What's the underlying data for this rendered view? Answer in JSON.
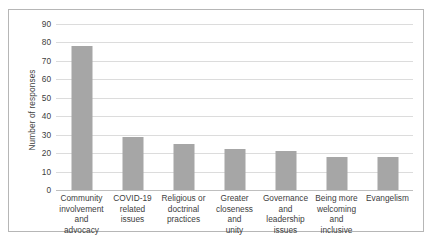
{
  "chart_data": {
    "type": "bar",
    "title": "",
    "xlabel": "",
    "ylabel": "Number of responses",
    "ylim": [
      0,
      90
    ],
    "ytick_step": 10,
    "yticks": [
      0,
      10,
      20,
      30,
      40,
      50,
      60,
      70,
      80,
      90
    ],
    "grid": true,
    "legend": false,
    "bar_color": "#a6a6a6",
    "categories": [
      "Community involvement and advocacy",
      "COVID-19 related issues",
      "Religious or doctrinal practices",
      "Greater closeness and unity",
      "Governance and leadership issues",
      "Being more welcoming and inclusive",
      "Evangelism"
    ],
    "category_lines": [
      [
        "Community",
        "involvement",
        "and advocacy"
      ],
      [
        "COVID-19",
        "related issues"
      ],
      [
        "Religious or",
        "doctrinal",
        "practices"
      ],
      [
        "Greater",
        "closeness and",
        "unity"
      ],
      [
        "Governance and",
        "leadership",
        "issues"
      ],
      [
        "Being more",
        "welcoming and",
        "inclusive"
      ],
      [
        "Evangelism"
      ]
    ],
    "values": [
      78,
      29,
      25,
      22,
      21,
      18,
      18
    ]
  }
}
